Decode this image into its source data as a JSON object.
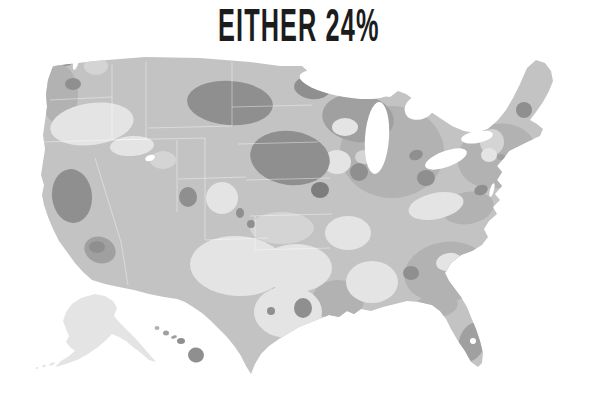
{
  "title": {
    "text": "EITHER 24%"
  },
  "figure": {
    "type": "choropleth-map",
    "region": "United States",
    "insets": [
      "Alaska",
      "Hawaii"
    ],
    "statistic_label": "EITHER",
    "statistic_value_percent": 24,
    "legend": "none shown",
    "shading_note": "grayscale county/region shading; darker = higher share, lighter = lower share"
  },
  "palette": {
    "background": "#ffffff",
    "water": "#ffffff",
    "base": "#c3c3c3",
    "light": "#e4e4e4",
    "mediumLight": "#d4d4d4",
    "medium": "#b2b2b2",
    "mediumDark": "#a0a0a0",
    "dark": "#8f8f8f",
    "darkest": "#7d7d7d",
    "title": "#1c1c1c",
    "stateLine": "#ffffff"
  },
  "map": {
    "patches": [
      {
        "name": "upper-midwest-region",
        "cx": 392,
        "cy": 152,
        "rx": 52,
        "ry": 46,
        "rot": 0,
        "shade": "medium"
      },
      {
        "name": "wisconsin-upper-michigan-region",
        "cx": 358,
        "cy": 118,
        "rx": 36,
        "ry": 24,
        "rot": 8,
        "shade": "mediumDark"
      },
      {
        "name": "northeast-region",
        "cx": 497,
        "cy": 156,
        "rx": 40,
        "ry": 32,
        "rot": -15,
        "shade": "medium"
      },
      {
        "name": "mid-atlantic-region",
        "cx": 468,
        "cy": 208,
        "rx": 26,
        "ry": 16,
        "rot": -10,
        "shade": "medium"
      },
      {
        "name": "southeast-region",
        "cx": 446,
        "cy": 272,
        "rx": 42,
        "ry": 30,
        "rot": -10,
        "shade": "medium"
      },
      {
        "name": "gulf-louisiana-region",
        "cx": 338,
        "cy": 300,
        "rx": 26,
        "ry": 20,
        "rot": 0,
        "shade": "medium"
      },
      {
        "name": "north-florida-region",
        "cx": 436,
        "cy": 306,
        "rx": 22,
        "ry": 12,
        "rot": -8,
        "shade": "medium"
      },
      {
        "name": "pacific-northwest-coast-region",
        "cx": 60,
        "cy": 95,
        "rx": 18,
        "ry": 30,
        "rot": 0,
        "shade": "medium"
      },
      {
        "name": "northwest-washington-light",
        "cx": 96,
        "cy": 66,
        "rx": 12,
        "ry": 9,
        "rot": 0,
        "shade": "mediumLight"
      },
      {
        "name": "oregon-idaho-light",
        "cx": 92,
        "cy": 124,
        "rx": 42,
        "ry": 21,
        "rot": -8,
        "shade": "light"
      },
      {
        "name": "snake-river-light",
        "cx": 132,
        "cy": 146,
        "rx": 22,
        "ry": 10,
        "rot": -4,
        "shade": "light"
      },
      {
        "name": "salt-lake-light",
        "cx": 163,
        "cy": 160,
        "rx": 13,
        "ry": 9,
        "rot": 0,
        "shade": "mediumLight"
      },
      {
        "name": "colorado-light",
        "cx": 222,
        "cy": 198,
        "rx": 16,
        "ry": 16,
        "rot": 0,
        "shade": "light"
      },
      {
        "name": "new-mexico-west-texas-light",
        "cx": 238,
        "cy": 266,
        "rx": 48,
        "ry": 30,
        "rot": 3,
        "shade": "light"
      },
      {
        "name": "central-texas-light",
        "cx": 288,
        "cy": 312,
        "rx": 34,
        "ry": 26,
        "rot": 0,
        "shade": "light"
      },
      {
        "name": "north-texas-oklahoma-light",
        "cx": 296,
        "cy": 268,
        "rx": 36,
        "ry": 24,
        "rot": 0,
        "shade": "light"
      },
      {
        "name": "kansas-light",
        "cx": 282,
        "cy": 228,
        "rx": 32,
        "ry": 16,
        "rot": 0,
        "shade": "mediumLight"
      },
      {
        "name": "iowa-light",
        "cx": 337,
        "cy": 162,
        "rx": 14,
        "ry": 12,
        "rot": 0,
        "shade": "light"
      },
      {
        "name": "north-wisconsin-light",
        "cx": 345,
        "cy": 127,
        "rx": 13,
        "ry": 9,
        "rot": 0,
        "shade": "light"
      },
      {
        "name": "north-illinois-light",
        "cx": 364,
        "cy": 157,
        "rx": 9,
        "ry": 7,
        "rot": 0,
        "shade": "mediumLight"
      },
      {
        "name": "arkansas-light",
        "cx": 348,
        "cy": 233,
        "rx": 23,
        "ry": 17,
        "rot": 0,
        "shade": "light"
      },
      {
        "name": "mississippi-alabama-light",
        "cx": 372,
        "cy": 282,
        "rx": 26,
        "ry": 21,
        "rot": 0,
        "shade": "light"
      },
      {
        "name": "kentucky-tennessee-light",
        "cx": 436,
        "cy": 206,
        "rx": 28,
        "ry": 13,
        "rot": -12,
        "shade": "light"
      },
      {
        "name": "south-carolina-light",
        "cx": 449,
        "cy": 262,
        "rx": 13,
        "ry": 9,
        "rot": -10,
        "shade": "light"
      },
      {
        "name": "new-england-light",
        "cx": 492,
        "cy": 142,
        "rx": 12,
        "ry": 13,
        "rot": 0,
        "shade": "mediumLight"
      },
      {
        "name": "hudson-valley-light",
        "cx": 489,
        "cy": 155,
        "rx": 8,
        "ry": 7,
        "rot": 0,
        "shade": "light"
      },
      {
        "name": "eastern-montana-dakotas-dark",
        "cx": 230,
        "cy": 103,
        "rx": 43,
        "ry": 22,
        "rot": 4,
        "shade": "dark"
      },
      {
        "name": "north-minnesota-dark",
        "cx": 312,
        "cy": 88,
        "rx": 18,
        "ry": 11,
        "rot": 8,
        "shade": "dark"
      },
      {
        "name": "nebraska-minnesota-dark",
        "cx": 290,
        "cy": 158,
        "rx": 40,
        "ry": 27,
        "rot": 8,
        "shade": "dark"
      },
      {
        "name": "south-minnesota-darkest",
        "cx": 320,
        "cy": 190,
        "rx": 9,
        "ry": 8,
        "rot": 0,
        "shade": "darkest"
      },
      {
        "name": "northern-california-dark",
        "cx": 72,
        "cy": 196,
        "rx": 20,
        "ry": 27,
        "rot": -6,
        "shade": "dark"
      },
      {
        "name": "seattle-dark",
        "cx": 66,
        "cy": 61,
        "rx": 7,
        "ry": 5,
        "rot": 0,
        "shade": "dark"
      },
      {
        "name": "tacoma-dark",
        "cx": 73,
        "cy": 84,
        "rx": 8,
        "ry": 6,
        "rot": 0,
        "shade": "dark"
      },
      {
        "name": "socal-medium-dark",
        "cx": 100,
        "cy": 250,
        "rx": 16,
        "ry": 13,
        "rot": 20,
        "shade": "mediumDark"
      },
      {
        "name": "los-angeles-dark",
        "cx": 97,
        "cy": 247,
        "rx": 8,
        "ry": 6,
        "rot": 0,
        "shade": "dark"
      },
      {
        "name": "central-utah-dark",
        "cx": 188,
        "cy": 197,
        "rx": 9,
        "ry": 10,
        "rot": 0,
        "shade": "dark"
      },
      {
        "name": "colorado-spot-dark-1",
        "cx": 240,
        "cy": 213,
        "rx": 4,
        "ry": 5,
        "rot": 0,
        "shade": "dark"
      },
      {
        "name": "colorado-spot-dark-2",
        "cx": 251,
        "cy": 224,
        "rx": 4,
        "ry": 4,
        "rot": 0,
        "shade": "dark"
      },
      {
        "name": "chicago-dark",
        "cx": 359,
        "cy": 172,
        "rx": 9,
        "ry": 9,
        "rot": 0,
        "shade": "dark"
      },
      {
        "name": "detroit-dark",
        "cx": 416,
        "cy": 155,
        "rx": 7,
        "ry": 5,
        "rot": -20,
        "shade": "dark"
      },
      {
        "name": "ohio-valley-dark",
        "cx": 426,
        "cy": 178,
        "rx": 9,
        "ry": 8,
        "rot": 0,
        "shade": "dark"
      },
      {
        "name": "new-york-city-dark",
        "cx": 501,
        "cy": 157,
        "rx": 4,
        "ry": 3,
        "rot": 0,
        "shade": "mediumDark"
      },
      {
        "name": "maine-dark",
        "cx": 524,
        "cy": 110,
        "rx": 8,
        "ry": 8,
        "rot": 0,
        "shade": "dark"
      },
      {
        "name": "south-florida-dark",
        "cx": 472,
        "cy": 342,
        "rx": 13,
        "ry": 20,
        "rot": 18,
        "shade": "mediumDark"
      },
      {
        "name": "houston-dark",
        "cx": 303,
        "cy": 308,
        "rx": 9,
        "ry": 10,
        "rot": 0,
        "shade": "dark"
      },
      {
        "name": "austin-dark",
        "cx": 271,
        "cy": 311,
        "rx": 4,
        "ry": 4,
        "rot": 0,
        "shade": "dark"
      },
      {
        "name": "atlanta-dark",
        "cx": 411,
        "cy": 273,
        "rx": 8,
        "ry": 7,
        "rot": 0,
        "shade": "dark"
      },
      {
        "name": "washington-dc-dark",
        "cx": 481,
        "cy": 190,
        "rx": 7,
        "ry": 5,
        "rot": -20,
        "shade": "dark"
      }
    ],
    "lakes": [
      {
        "name": "lake-superior",
        "cx": 345,
        "cy": 84,
        "rx": 46,
        "ry": 13,
        "rot": 10,
        "shade": "water"
      },
      {
        "name": "lake-michigan",
        "cx": 377,
        "cy": 138,
        "rx": 12,
        "ry": 36,
        "rot": 4,
        "shade": "water"
      },
      {
        "name": "lake-huron",
        "cx": 420,
        "cy": 107,
        "rx": 16,
        "ry": 12,
        "rot": -25,
        "shade": "water"
      },
      {
        "name": "lake-erie",
        "cx": 446,
        "cy": 159,
        "rx": 22,
        "ry": 8,
        "rot": -20,
        "shade": "water"
      },
      {
        "name": "lake-ontario",
        "cx": 477,
        "cy": 137,
        "rx": 16,
        "ry": 6,
        "rot": -10,
        "shade": "water"
      },
      {
        "name": "puget-sound",
        "cx": 76,
        "cy": 62,
        "rx": 2.5,
        "ry": 8,
        "rot": 15,
        "shade": "water"
      },
      {
        "name": "great-salt-lake",
        "cx": 150,
        "cy": 158,
        "rx": 5,
        "ry": 3,
        "rot": -20,
        "shade": "water"
      },
      {
        "name": "chesapeake-bay",
        "cx": 492,
        "cy": 190,
        "rx": 2,
        "ry": 7,
        "rot": 15,
        "shade": "water"
      },
      {
        "name": "lake-okeechobee",
        "cx": 473,
        "cy": 341,
        "rx": 3,
        "ry": 3,
        "rot": 0,
        "shade": "water"
      }
    ],
    "islands": [
      {
        "name": "kauai",
        "cx": 157,
        "cy": 328,
        "rx": 2.5,
        "ry": 2,
        "rot": 0,
        "shade": "medium"
      },
      {
        "name": "oahu",
        "cx": 166,
        "cy": 333,
        "rx": 3,
        "ry": 2.5,
        "rot": 0,
        "shade": "mediumDark"
      },
      {
        "name": "molokai",
        "cx": 174,
        "cy": 337,
        "rx": 3,
        "ry": 1.5,
        "rot": -15,
        "shade": "mediumDark"
      },
      {
        "name": "maui",
        "cx": 181,
        "cy": 341,
        "rx": 4,
        "ry": 3,
        "rot": 0,
        "shade": "dark"
      },
      {
        "name": "hawaii-big-island",
        "cx": 196,
        "cy": 355,
        "rx": 8,
        "ry": 7.5,
        "rot": 15,
        "shade": "dark"
      },
      {
        "name": "aleutian-island-1",
        "cx": 52,
        "cy": 364,
        "rx": 3,
        "ry": 1.2,
        "rot": -25,
        "shade": "light"
      },
      {
        "name": "aleutian-island-2",
        "cx": 44,
        "cy": 366,
        "rx": 2,
        "ry": 1,
        "rot": -20,
        "shade": "light"
      },
      {
        "name": "aleutian-island-3",
        "cx": 37,
        "cy": 368,
        "rx": 1.5,
        "ry": 0.8,
        "rot": -15,
        "shade": "light"
      }
    ],
    "state_lines": [
      [
        50,
        100,
        112,
        97
      ],
      [
        44,
        142,
        146,
        139
      ],
      [
        112,
        64,
        112,
        140
      ],
      [
        146,
        62,
        146,
        139
      ],
      [
        95,
        158,
        121,
        242
      ],
      [
        121,
        242,
        128,
        285
      ],
      [
        112,
        140,
        205,
        138
      ],
      [
        177,
        140,
        177,
        212
      ],
      [
        205,
        138,
        205,
        240
      ],
      [
        148,
        128,
        232,
        126
      ],
      [
        178,
        179,
        246,
        177
      ],
      [
        205,
        240,
        268,
        238
      ],
      [
        232,
        62,
        232,
        126
      ],
      [
        232,
        107,
        312,
        105
      ],
      [
        238,
        144,
        318,
        142
      ],
      [
        246,
        180,
        330,
        178
      ],
      [
        250,
        216,
        332,
        214
      ],
      [
        255,
        216,
        255,
        251
      ],
      [
        255,
        250,
        330,
        248
      ]
    ]
  }
}
